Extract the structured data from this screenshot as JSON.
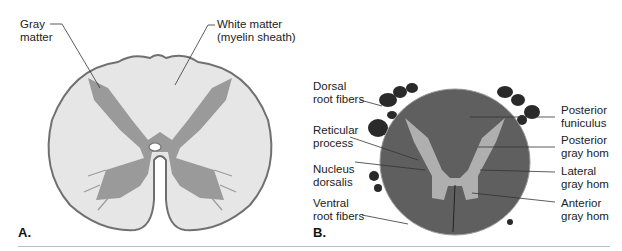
{
  "figure": {
    "panel_a": {
      "letter": "A.",
      "labels": {
        "gray_matter": "Gray\nmatter",
        "white_matter": "White matter\n(myelin sheath)"
      }
    },
    "panel_b": {
      "letter": "B.",
      "labels_left": {
        "dorsal_root_fibers": "Dorsal\nroot fibers",
        "reticular_process": "Reticular\nprocess",
        "nucleus_dorsalis": "Nucleus\ndorsalis",
        "ventral_root_fibers": "Ventral\nroot fibers"
      },
      "labels_right": {
        "posterior_funiculus": "Posterior\nfuniculus",
        "posterior_gray_horn": "Posterior\ngray hom",
        "lateral_gray_horn": "Lateral\ngray hom",
        "anterior_gray_horn": "Anterior\ngray hom"
      }
    },
    "colors": {
      "gray_matter": "#9a9a9a",
      "white_matter": "#e6e6e6",
      "outline": "#707070",
      "histology_dark": "#5a5a5a",
      "histology_light": "#b8b8b8"
    }
  }
}
